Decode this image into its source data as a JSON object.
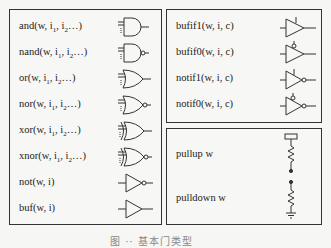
{
  "left_panel": {
    "gates": [
      {
        "name": "and",
        "label": "and(w, i",
        "icon": "and-gate-icon"
      },
      {
        "name": "nand",
        "label": "nand(w, i",
        "icon": "nand-gate-icon"
      },
      {
        "name": "or",
        "label": "or(w, i",
        "icon": "or-gate-icon"
      },
      {
        "name": "nor",
        "label": "nor(w, i",
        "icon": "nor-gate-icon"
      },
      {
        "name": "xor",
        "label": "xor(w, i",
        "icon": "xor-gate-icon"
      },
      {
        "name": "xnor",
        "label": "xnor(w, i",
        "icon": "xnor-gate-icon"
      },
      {
        "name": "not",
        "label": "not(w, i)",
        "icon": "not-gate-icon"
      },
      {
        "name": "buf",
        "label": "buf(w, i)",
        "icon": "buffer-gate-icon"
      }
    ],
    "multi_input_suffix": {
      "sub1": "1",
      "mid": ", i",
      "sub2": "2",
      "tail": "…)"
    }
  },
  "right_top_panel": {
    "gates": [
      {
        "name": "bufif1",
        "label": "bufif1(w, i, c)",
        "icon": "bufif1-icon"
      },
      {
        "name": "bufif0",
        "label": "bufif0(w, i, c)",
        "icon": "bufif0-icon"
      },
      {
        "name": "notif1",
        "label": "notif1(w, i, c)",
        "icon": "notif1-icon"
      },
      {
        "name": "notif0",
        "label": "notif0(w, i, c)",
        "icon": "notif0-icon"
      }
    ]
  },
  "right_bottom_panel": {
    "items": [
      {
        "name": "pullup",
        "label": "pullup w",
        "icon": "pullup-resistor-icon"
      },
      {
        "name": "pulldown",
        "label": "pulldown w",
        "icon": "pulldown-resistor-icon"
      }
    ]
  },
  "caption": "图 ·· 基本门类型"
}
